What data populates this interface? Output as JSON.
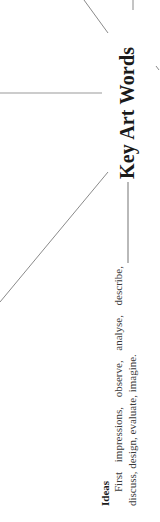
{
  "diagram": {
    "orientation": "rotated-90-ccw",
    "hub": {
      "label": "Key Art Words"
    },
    "nodes": [
      {
        "title": "Ideas",
        "text": "First impressions, observe, analyse, describe, discuss, design, evaluate, imagine."
      }
    ],
    "colors": {
      "line": "#8a8a8a",
      "text": "#2a2a2a",
      "background": "#ffffff"
    }
  }
}
